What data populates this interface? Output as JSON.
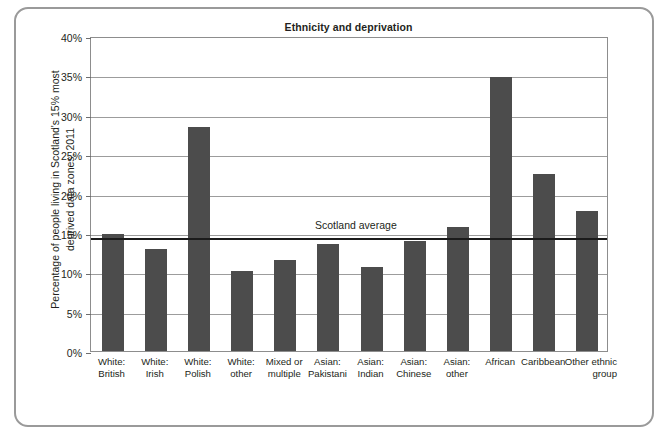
{
  "chart_data": {
    "type": "bar",
    "title": "Ethnicity and deprivation",
    "xlabel": "",
    "ylabel": "Percentage of people living in Scotland's 15% most\ndeprived data zones, 2011",
    "ylim": [
      0,
      40
    ],
    "ytick_labels": [
      "0%",
      "5%",
      "10%",
      "15%",
      "20%",
      "25%",
      "30%",
      "35%",
      "40%"
    ],
    "ytick_values": [
      0,
      5,
      10,
      15,
      20,
      25,
      30,
      35,
      40
    ],
    "grid": true,
    "legend": "none",
    "categories": [
      "White:\nBritish",
      "White:\nIrish",
      "White:\nPolish",
      "White:\nother",
      "Mixed or\nmultiple",
      "Asian:\nPakistani",
      "Asian:\nIndian",
      "Asian:\nChinese",
      "Asian:\nother",
      "African",
      "Caribbean",
      "Other ethnic\ngroup"
    ],
    "values": [
      14.8,
      13.0,
      28.4,
      10.1,
      11.6,
      13.6,
      10.7,
      14.0,
      15.7,
      34.8,
      22.5,
      17.8
    ],
    "annotations": [
      {
        "name": "scotland-average",
        "label": "Scotland average",
        "type": "hline",
        "value": 14.5
      }
    ],
    "bar_color": "#4c4c4c",
    "axis_color": "#8d8d8d",
    "gridline_color": "#9c9c9c",
    "average_line_color": "#1b1b1b"
  },
  "frame": {
    "border_color": "#9a9a9a"
  }
}
